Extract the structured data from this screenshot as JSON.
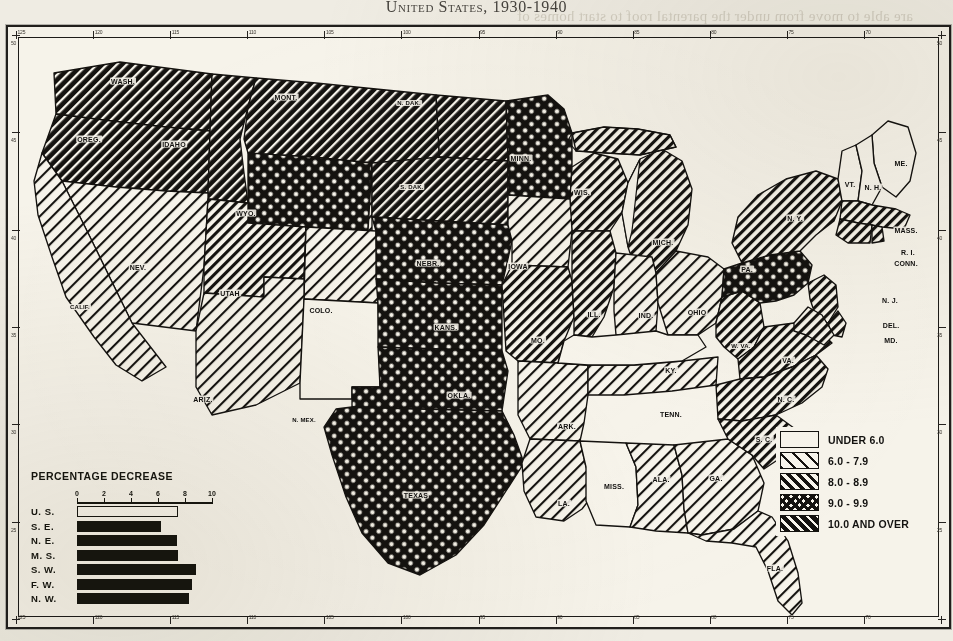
{
  "page": {
    "title": "United States, 1930-1940",
    "background_color": "#f4f1e8",
    "ink_color": "#141310"
  },
  "ghost_text": [
    "are able to move from under the parental roof to start homes of",
    "their own.  The trend is explained partly by the fact that the re-",
    "period when land values were low and when farm operators",
    "such farms as a means of security during the depression",
    "",
    "",
    "",
    "",
    "",
    "",
    "certain areas of the country the movement of young people",
    "defected by the drought and dust storms of the middle thirties",
    "number of farms in these areas declined markedly as a result",
    "the population pressure on the land was relieved somewhat by",
    "",
    "",
    "",
    "",
    "",
    "combined, 11.2 percent decline.  The Far West was the only",
    "tion and the proportion of its farm homes reached the",
    "that was derived from the United States totals of farmers"
  ],
  "legend": {
    "entries": [
      {
        "label": "UNDER 6.0",
        "pattern": "blank"
      },
      {
        "label": "6.0 - 7.9",
        "pattern": "hatch-light"
      },
      {
        "label": "8.0 - 8.9",
        "pattern": "hatch-medium"
      },
      {
        "label": "9.0 - 9.9",
        "pattern": "crosshatch"
      },
      {
        "label": "10.0 AND OVER",
        "pattern": "hatch-dense"
      }
    ]
  },
  "chart_data": {
    "type": "bar",
    "title": "PERCENTAGE DECREASE",
    "orientation": "horizontal",
    "categories": [
      "U. S.",
      "S. E.",
      "N. E.",
      "M. S.",
      "S. W.",
      "F. W.",
      "N. W."
    ],
    "values": [
      7.5,
      6.2,
      7.4,
      7.5,
      8.8,
      8.5,
      8.3
    ],
    "xlabel": "",
    "ylabel": "",
    "xlim": [
      0,
      10
    ],
    "xticks": [
      0,
      2,
      4,
      6,
      8,
      10
    ],
    "xtick_labels": [
      "0",
      "2",
      "4",
      "6",
      "8",
      "10"
    ],
    "bar_styles": [
      "hollow",
      "filled",
      "filled",
      "filled",
      "filled",
      "filled",
      "filled"
    ],
    "grid": false,
    "legend": "none"
  },
  "map": {
    "states": [
      {
        "abbr": "WASH.",
        "x": 107,
        "y": 46,
        "pattern": "hatch-dense"
      },
      {
        "abbr": "OREG.",
        "x": 73,
        "y": 104,
        "pattern": "hatch-dense"
      },
      {
        "abbr": "IDAHO",
        "x": 158,
        "y": 109,
        "pattern": "hatch-dense"
      },
      {
        "abbr": "MONT.",
        "x": 270,
        "y": 62,
        "pattern": "hatch-dense"
      },
      {
        "abbr": "N. DAK.",
        "x": 393,
        "y": 68,
        "pattern": "hatch-dense"
      },
      {
        "abbr": "S. DAK.",
        "x": 396,
        "y": 152,
        "pattern": "hatch-dense"
      },
      {
        "abbr": "WYO.",
        "x": 230,
        "y": 178,
        "pattern": "crosshatch"
      },
      {
        "abbr": "MINN.",
        "x": 505,
        "y": 123,
        "pattern": "crosshatch"
      },
      {
        "abbr": "NEBR.",
        "x": 412,
        "y": 228,
        "pattern": "crosshatch"
      },
      {
        "abbr": "KANS.",
        "x": 430,
        "y": 292,
        "pattern": "crosshatch"
      },
      {
        "abbr": "OKLA.",
        "x": 443,
        "y": 360,
        "pattern": "crosshatch"
      },
      {
        "abbr": "TEXAS",
        "x": 400,
        "y": 460,
        "pattern": "crosshatch"
      },
      {
        "abbr": "PA.",
        "x": 731,
        "y": 234,
        "pattern": "crosshatch"
      },
      {
        "abbr": "NEV.",
        "x": 122,
        "y": 232,
        "pattern": "hatch-light"
      },
      {
        "abbr": "CALIF.",
        "x": 64,
        "y": 272,
        "pattern": "hatch-light"
      },
      {
        "abbr": "UTAH",
        "x": 214,
        "y": 258,
        "pattern": "hatch-medium"
      },
      {
        "abbr": "COLO.",
        "x": 305,
        "y": 275,
        "pattern": "hatch-light"
      },
      {
        "abbr": "ARIZ.",
        "x": 187,
        "y": 364,
        "pattern": "hatch-light"
      },
      {
        "abbr": "N. MEX.",
        "x": 288,
        "y": 385,
        "pattern": "blank"
      },
      {
        "abbr": "IOWA",
        "x": 502,
        "y": 231,
        "pattern": "hatch-light"
      },
      {
        "abbr": "MO.",
        "x": 522,
        "y": 305,
        "pattern": "hatch-medium"
      },
      {
        "abbr": "ILL.",
        "x": 578,
        "y": 279,
        "pattern": "hatch-medium"
      },
      {
        "abbr": "WIS.",
        "x": 566,
        "y": 157,
        "pattern": "hatch-medium"
      },
      {
        "abbr": "MICH.",
        "x": 647,
        "y": 207,
        "pattern": "hatch-medium"
      },
      {
        "abbr": "IND.",
        "x": 630,
        "y": 280,
        "pattern": "hatch-light"
      },
      {
        "abbr": "OHIO",
        "x": 681,
        "y": 277,
        "pattern": "hatch-light"
      },
      {
        "abbr": "KY.",
        "x": 655,
        "y": 335,
        "pattern": "blank"
      },
      {
        "abbr": "W. VA.",
        "x": 725,
        "y": 311,
        "pattern": "hatch-medium"
      },
      {
        "abbr": "VA.",
        "x": 772,
        "y": 325,
        "pattern": "hatch-medium"
      },
      {
        "abbr": "N. C.",
        "x": 770,
        "y": 364,
        "pattern": "hatch-medium"
      },
      {
        "abbr": "S. C.",
        "x": 748,
        "y": 404,
        "pattern": "hatch-medium"
      },
      {
        "abbr": "TENN.",
        "x": 655,
        "y": 379,
        "pattern": "hatch-light"
      },
      {
        "abbr": "ARK.",
        "x": 551,
        "y": 391,
        "pattern": "hatch-light"
      },
      {
        "abbr": "MISS.",
        "x": 598,
        "y": 451,
        "pattern": "blank"
      },
      {
        "abbr": "ALA.",
        "x": 645,
        "y": 444,
        "pattern": "hatch-light"
      },
      {
        "abbr": "GA.",
        "x": 700,
        "y": 443,
        "pattern": "hatch-light"
      },
      {
        "abbr": "LA.",
        "x": 548,
        "y": 468,
        "pattern": "hatch-light"
      },
      {
        "abbr": "FLA.",
        "x": 759,
        "y": 533,
        "pattern": "hatch-light"
      },
      {
        "abbr": "N. Y.",
        "x": 779,
        "y": 183,
        "pattern": "hatch-medium"
      },
      {
        "abbr": "ME.",
        "x": 885,
        "y": 128,
        "pattern": "blank"
      },
      {
        "abbr": "VT.",
        "x": 834,
        "y": 149,
        "pattern": "blank"
      },
      {
        "abbr": "N. H.",
        "x": 857,
        "y": 152,
        "pattern": "blank"
      },
      {
        "abbr": "MASS.",
        "x": 890,
        "y": 195,
        "pattern": "hatch-medium"
      },
      {
        "abbr": "R. I.",
        "x": 892,
        "y": 217,
        "pattern": "hatch-medium"
      },
      {
        "abbr": "CONN.",
        "x": 890,
        "y": 228,
        "pattern": "hatch-medium"
      },
      {
        "abbr": "N. J.",
        "x": 874,
        "y": 265,
        "pattern": "hatch-medium"
      },
      {
        "abbr": "DEL.",
        "x": 875,
        "y": 290,
        "pattern": "hatch-medium"
      },
      {
        "abbr": "MD.",
        "x": 875,
        "y": 305,
        "pattern": "hatch-medium"
      }
    ]
  },
  "rulers": {
    "top_labels": [
      "125",
      "120",
      "115",
      "110",
      "105",
      "100",
      "95",
      "90",
      "85",
      "80",
      "75",
      "70"
    ],
    "bottom_labels": [
      "125",
      "120",
      "115",
      "110",
      "105",
      "100",
      "95",
      "90",
      "85",
      "80",
      "75",
      "70"
    ],
    "left_labels": [
      "50",
      "45",
      "40",
      "35",
      "30",
      "25"
    ],
    "right_labels": [
      "50",
      "45",
      "40",
      "35",
      "30",
      "25"
    ]
  }
}
